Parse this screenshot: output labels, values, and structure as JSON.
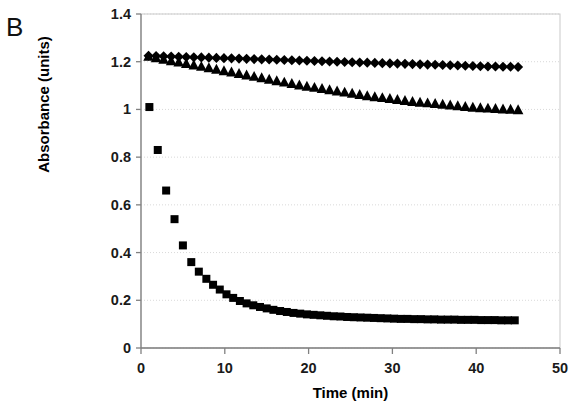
{
  "figure": {
    "panel_label": "B",
    "background_color": "#ffffff",
    "marker_color": "#000000",
    "axis_color": "#808080",
    "grid_color": "#d9d9d9"
  },
  "chart_data": {
    "type": "scatter",
    "title": "",
    "panel": "B",
    "xlabel": "Time (min)",
    "ylabel": "Absorbance (units)",
    "xlim": [
      0,
      50
    ],
    "ylim": [
      0,
      1.4
    ],
    "xticks": [
      0,
      10,
      20,
      30,
      40,
      50
    ],
    "xtick_labels": [
      "0",
      "10",
      "20",
      "30",
      "40",
      "50"
    ],
    "yticks": [
      0,
      0.2,
      0.4,
      0.6,
      0.8,
      1,
      1.2,
      1.4
    ],
    "ytick_labels": [
      "0",
      "0.2",
      "0.4",
      "0.6",
      "0.8",
      "1",
      "1.2",
      "1.4"
    ],
    "grid": "horizontal-dotted",
    "legend": "none",
    "series": [
      {
        "name": "diamonds",
        "marker": "diamond",
        "color": "#000000",
        "marker_size": 7.5,
        "x": [
          0.9,
          1.8,
          2.7,
          3.6,
          4.5,
          5.4,
          6.3,
          7.2,
          8.1,
          9.0,
          9.9,
          10.8,
          11.7,
          12.6,
          13.5,
          14.4,
          15.3,
          16.2,
          17.1,
          18.0,
          18.9,
          19.8,
          20.7,
          21.6,
          22.5,
          23.4,
          24.3,
          25.2,
          26.1,
          27.0,
          27.9,
          28.8,
          29.7,
          30.6,
          31.5,
          32.4,
          33.3,
          34.2,
          35.1,
          36.0,
          36.9,
          37.8,
          38.7,
          39.6,
          40.5,
          41.4,
          42.3,
          43.2,
          44.1,
          45.0
        ],
        "y": [
          1.225,
          1.224,
          1.223,
          1.222,
          1.221,
          1.22,
          1.219,
          1.218,
          1.217,
          1.216,
          1.215,
          1.214,
          1.213,
          1.212,
          1.211,
          1.21,
          1.209,
          1.208,
          1.207,
          1.206,
          1.205,
          1.204,
          1.203,
          1.202,
          1.201,
          1.2,
          1.199,
          1.198,
          1.197,
          1.196,
          1.195,
          1.194,
          1.193,
          1.192,
          1.191,
          1.19,
          1.189,
          1.188,
          1.187,
          1.186,
          1.185,
          1.184,
          1.183,
          1.182,
          1.181,
          1.18,
          1.18,
          1.179,
          1.179,
          1.178
        ]
      },
      {
        "name": "triangles",
        "marker": "triangle",
        "color": "#000000",
        "marker_size": 8,
        "x": [
          0.9,
          1.8,
          2.7,
          3.6,
          4.5,
          5.4,
          6.3,
          7.2,
          8.1,
          9.0,
          9.9,
          10.8,
          11.7,
          12.6,
          13.5,
          14.4,
          15.3,
          16.2,
          17.1,
          18.0,
          18.9,
          19.8,
          20.7,
          21.6,
          22.5,
          23.4,
          24.3,
          25.2,
          26.1,
          27.0,
          27.9,
          28.8,
          29.7,
          30.6,
          31.5,
          32.4,
          33.3,
          34.2,
          35.1,
          36.0,
          36.9,
          37.8,
          38.7,
          39.6,
          40.5,
          41.4,
          42.3,
          43.2,
          44.1,
          45.0
        ],
        "y": [
          1.222,
          1.216,
          1.21,
          1.204,
          1.198,
          1.192,
          1.186,
          1.18,
          1.174,
          1.168,
          1.162,
          1.156,
          1.15,
          1.144,
          1.138,
          1.132,
          1.126,
          1.12,
          1.114,
          1.108,
          1.102,
          1.097,
          1.092,
          1.087,
          1.082,
          1.077,
          1.072,
          1.067,
          1.062,
          1.057,
          1.053,
          1.049,
          1.045,
          1.041,
          1.037,
          1.033,
          1.03,
          1.027,
          1.024,
          1.021,
          1.018,
          1.015,
          1.012,
          1.009,
          1.007,
          1.005,
          1.003,
          1.001,
          1.0,
          0.998
        ]
      },
      {
        "name": "squares",
        "marker": "square",
        "color": "#000000",
        "marker_size": 8,
        "x": [
          1.0,
          2.0,
          3.0,
          4.0,
          5.0,
          6.0,
          6.9,
          7.8,
          8.6,
          9.4,
          10.2,
          11.0,
          11.8,
          12.6,
          13.4,
          14.2,
          15.0,
          15.8,
          16.6,
          17.4,
          18.2,
          19.0,
          19.8,
          20.6,
          21.4,
          22.2,
          23.0,
          23.8,
          24.6,
          25.4,
          26.2,
          27.0,
          27.8,
          28.6,
          29.4,
          30.2,
          31.0,
          31.8,
          32.6,
          33.4,
          34.2,
          35.0,
          35.8,
          36.6,
          37.4,
          38.2,
          39.0,
          39.8,
          40.6,
          41.4,
          42.2,
          43.0,
          43.8,
          44.6
        ],
        "y": [
          1.01,
          0.83,
          0.66,
          0.54,
          0.43,
          0.36,
          0.32,
          0.29,
          0.265,
          0.245,
          0.225,
          0.21,
          0.197,
          0.187,
          0.179,
          0.172,
          0.166,
          0.16,
          0.155,
          0.151,
          0.147,
          0.144,
          0.141,
          0.139,
          0.137,
          0.135,
          0.133,
          0.132,
          0.13,
          0.129,
          0.128,
          0.127,
          0.126,
          0.125,
          0.124,
          0.123,
          0.122,
          0.122,
          0.121,
          0.121,
          0.12,
          0.12,
          0.119,
          0.119,
          0.119,
          0.118,
          0.118,
          0.118,
          0.117,
          0.117,
          0.117,
          0.116,
          0.116,
          0.116
        ]
      }
    ]
  }
}
